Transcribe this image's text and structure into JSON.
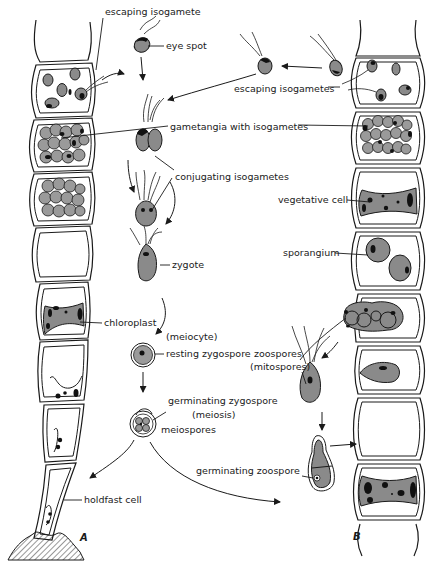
{
  "figure": {
    "panels": [
      {
        "id": "A",
        "label": "A"
      },
      {
        "id": "B",
        "label": "B"
      }
    ]
  },
  "labels": {
    "escaping_isogamete": "escaping isogamete",
    "eye_spot": "eye spot",
    "escaping_isogametes": "escaping isogametes",
    "gametangia_with_isogametes": "gametangia  with isogametes",
    "conjugating_isogametes": "conjugating isogametes",
    "vegetative_cell": "vegetative cell",
    "sporangium": "sporangium",
    "zygote": "zygote",
    "chloroplast": "chloroplast",
    "meiocyte": "(meiocyte)",
    "resting_zygospore": "resting zygospore",
    "zoospores": "zoospores",
    "mitospores": "(mitospores)",
    "germinating_zygospore": "germinating zygospore",
    "meiosis": "(meiosis)",
    "meiospores": "meiospores",
    "germinating_zoospore": "germinating zoospore",
    "holdfast_cell": "holdfast cell"
  },
  "colors": {
    "ink": "#1a1a1a",
    "cell_fill": "#8a8a8a",
    "background": "#ffffff"
  }
}
